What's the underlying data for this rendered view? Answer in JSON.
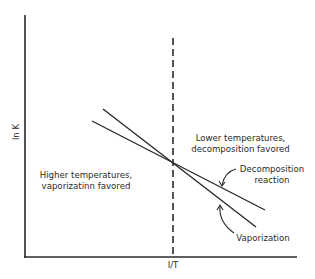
{
  "diagram": {
    "axes": {
      "x_label": "I/T",
      "y_label": "ln K"
    },
    "divider": {
      "style": "dashed",
      "position": "crossover point of the two lines"
    },
    "regions": {
      "left": {
        "line1": "Higher temperatures,",
        "line2": "vaporizatinn favored"
      },
      "right": {
        "line1": "Lower temperatures,",
        "line2": "decomposition favored"
      }
    },
    "lines": [
      {
        "name": "Decomposition reaction",
        "label_line1": "Decomposition",
        "label_line2": "reaction",
        "slope": "shallower"
      },
      {
        "name": "Vaporization",
        "label_line1": "Vaporization",
        "slope": "steeper"
      }
    ],
    "colors": {
      "ink": "#2a2a2a",
      "background": "#ffffff"
    }
  }
}
